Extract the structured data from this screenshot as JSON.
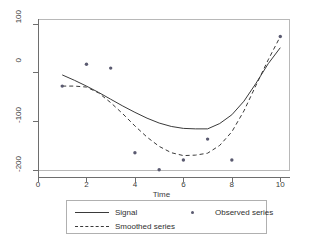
{
  "chart_data": {
    "type": "line",
    "title": "",
    "xlabel": "Time",
    "ylabel": "",
    "xlim": [
      0,
      10.4
    ],
    "ylim": [
      -215,
      110
    ],
    "xticks": [
      0,
      2,
      4,
      6,
      8,
      10
    ],
    "yticks": [
      100,
      0,
      -100,
      -200
    ],
    "xtick_labels": [
      "0",
      "2",
      "4",
      "6",
      "8",
      "10"
    ],
    "ytick_labels": [
      "100",
      "0",
      "-100",
      "-200"
    ],
    "grid": false,
    "legend_position": "below-plot",
    "series": [
      {
        "name": "Signal",
        "style": "solid",
        "color": "#3a3a3a",
        "x": [
          1,
          1.5,
          2,
          2.5,
          3,
          3.5,
          4,
          4.5,
          5,
          5.5,
          6,
          6.5,
          7,
          7.5,
          8,
          8.5,
          9,
          9.5,
          10
        ],
        "values": [
          -5,
          -16,
          -28,
          -41,
          -55,
          -69,
          -82,
          -94,
          -104,
          -111,
          -115,
          -116,
          -116,
          -105,
          -87,
          -59,
          -22,
          18,
          51
        ]
      },
      {
        "name": "Smoothed series",
        "style": "dashed",
        "color": "#3a3a3a",
        "x": [
          1,
          1.5,
          2,
          2.5,
          3,
          3.5,
          4,
          4.5,
          5,
          5.5,
          6,
          6.5,
          7,
          7.5,
          8,
          8.5,
          9,
          9.5,
          10
        ],
        "values": [
          -28,
          -28,
          -30,
          -42,
          -62,
          -85,
          -110,
          -133,
          -152,
          -165,
          -171,
          -170,
          -166,
          -150,
          -122,
          -79,
          -26,
          26,
          74
        ]
      },
      {
        "name": "Observed series",
        "style": "markers",
        "color": "#5a5a70",
        "x": [
          1,
          2,
          3,
          4,
          5,
          6,
          7,
          8,
          10
        ],
        "values": [
          -28,
          17,
          9,
          -165,
          -200,
          -180,
          -137,
          -180,
          74
        ]
      }
    ]
  },
  "legend": {
    "signal_label": "Signal",
    "smoothed_label": "Smoothed series",
    "observed_label": "Observed series"
  },
  "axis": {
    "x_title": "Time"
  }
}
